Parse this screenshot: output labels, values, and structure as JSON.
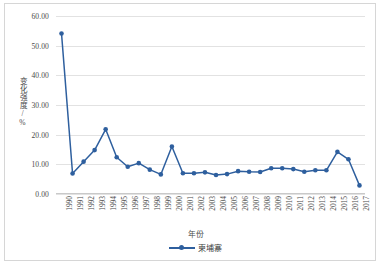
{
  "chart_data": {
    "type": "line",
    "title": "",
    "xlabel": "年份",
    "ylabel": "变化强度/%",
    "ylim": [
      0,
      60
    ],
    "yticks": [
      "0.00",
      "10.00",
      "20.00",
      "30.00",
      "40.00",
      "50.00",
      "60.00"
    ],
    "ytick_values": [
      0,
      10,
      20,
      30,
      40,
      50,
      60
    ],
    "grid": true,
    "legend_position": "bottom",
    "series_color": "#2e5f9e",
    "grid_color": "#e2e2e2",
    "border_color": "#d6d6d6",
    "categories": [
      "1990",
      "1991",
      "1992",
      "1993",
      "1994",
      "1995",
      "1996",
      "1997",
      "1998",
      "1999",
      "2000",
      "2001",
      "2002",
      "2003",
      "2004",
      "2005",
      "2006",
      "2007",
      "2008",
      "2009",
      "2010",
      "2011",
      "2012",
      "2013",
      "2014",
      "2015",
      "2016",
      "2017"
    ],
    "series": [
      {
        "name": "柬埔寨",
        "values": [
          54.1,
          6.9,
          10.9,
          14.8,
          21.8,
          12.4,
          9.2,
          10.4,
          8.2,
          6.6,
          16.0,
          7.0,
          7.0,
          7.3,
          6.4,
          6.7,
          7.7,
          7.5,
          7.4,
          8.7,
          8.7,
          8.4,
          7.5,
          8.0,
          8.0,
          14.2,
          11.7,
          2.9
        ]
      }
    ]
  },
  "legend": {
    "label": "柬埔寨"
  },
  "axes": {
    "x_title": "年份",
    "y_title": "变化强度/%"
  }
}
